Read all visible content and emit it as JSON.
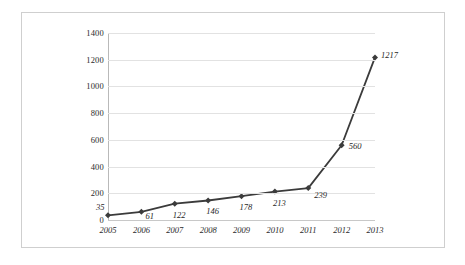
{
  "chart_data": {
    "type": "line",
    "title": "",
    "subtitle": "",
    "xlabel": "",
    "ylabel": "",
    "categories": [
      "2005",
      "2006",
      "2007",
      "2008",
      "2009",
      "2010",
      "2011",
      "2012",
      "2013"
    ],
    "values": [
      35,
      61,
      122,
      146,
      178,
      213,
      239,
      560,
      1217
    ],
    "point_labels": [
      "35",
      "61",
      "122",
      "146",
      "178",
      "213",
      "239",
      "560",
      "1217"
    ],
    "ylim": [
      0,
      1400
    ],
    "yticks": [
      0,
      200,
      400,
      600,
      800,
      1000,
      1200,
      1400
    ],
    "ytick_labels": [
      "0",
      "200",
      "400",
      "600",
      "800",
      "1000",
      "1200",
      "1400"
    ],
    "xtick_labels": [
      "2005",
      "2006",
      "2007",
      "2008",
      "2009",
      "2010",
      "2011",
      "2012",
      "2013"
    ],
    "grid": "horizontal",
    "legend": "none",
    "marker": "diamond",
    "series_color": "#3b3b3b",
    "gridline_color": "#e2e2e2",
    "axis_color": "#b9b9b9",
    "label_color": "#2b2b2b",
    "background_color": "#ffffff",
    "frame_color": "#cfcfcf"
  }
}
